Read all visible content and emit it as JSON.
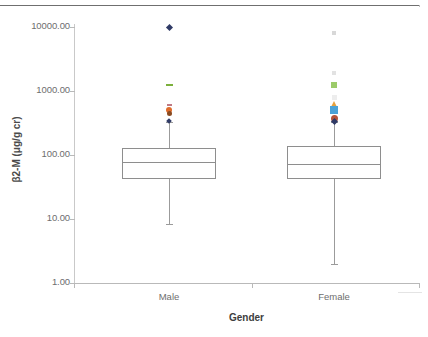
{
  "chart_data": {
    "type": "box",
    "title": "",
    "xlabel": "Gender",
    "ylabel": "β2-M (μg/g cr)",
    "yscale": "log",
    "ylim": [
      1.0,
      10000.0
    ],
    "grid": false,
    "legend": "none",
    "y_ticks": [
      {
        "label": "10000.00",
        "value": 10000.0
      },
      {
        "label": "1000.00",
        "value": 1000.0
      },
      {
        "label": "100.00",
        "value": 100.0
      },
      {
        "label": "10.00",
        "value": 10.0
      },
      {
        "label": "1.00",
        "value": 1.0
      }
    ],
    "categories": [
      "Male",
      "Female"
    ],
    "boxes": [
      {
        "name": "Male",
        "whisker_low": 8.5,
        "q1": 42.0,
        "median": 78.0,
        "q3": 130.0,
        "whisker_high": 330.0,
        "outliers": [
          {
            "value": 10000.0,
            "color": "#2f3a66",
            "shape": "diamond",
            "size": 5
          },
          {
            "value": 1250.0,
            "color": "#7cb03c",
            "shape": "dash",
            "size": 7
          },
          {
            "value": 600.0,
            "color": "#c07a84",
            "shape": "dash",
            "size": 5
          },
          {
            "value": 500.0,
            "color": "#e06c2a",
            "shape": "circle",
            "size": 6
          },
          {
            "value": 440.0,
            "color": "#8a4a20",
            "shape": "circle",
            "size": 5
          },
          {
            "value": 340.0,
            "color": "#2f3a66",
            "shape": "diamond",
            "size": 4
          }
        ]
      },
      {
        "name": "Female",
        "whisker_low": 2.0,
        "q1": 42.0,
        "median": 72.0,
        "q3": 140.0,
        "whisker_high": 330.0,
        "outliers": [
          {
            "value": 8000.0,
            "color": "#d8d8d8",
            "shape": "square",
            "size": 4
          },
          {
            "value": 1900.0,
            "color": "#e2e2e2",
            "shape": "square",
            "size": 4
          },
          {
            "value": 1250.0,
            "color": "#9ccb6a",
            "shape": "square",
            "size": 6
          },
          {
            "value": 800.0,
            "color": "#ededed",
            "shape": "square",
            "size": 5
          },
          {
            "value": 620.0,
            "color": "#e8a13c",
            "shape": "triangle",
            "size": 6
          },
          {
            "value": 500.0,
            "color": "#4ba3d8",
            "shape": "square",
            "size": 8
          },
          {
            "value": 370.0,
            "color": "#b5543a",
            "shape": "circle",
            "size": 7
          },
          {
            "value": 330.0,
            "color": "#2f3a66",
            "shape": "diamond",
            "size": 5
          }
        ]
      }
    ]
  },
  "axes": {
    "y_title": "β2-M (μg/g cr)",
    "x_title": "Gender",
    "y_labels": [
      "10000.00",
      "1000.00",
      "100.00",
      "10.00",
      "1.00"
    ],
    "x_labels": [
      "Male",
      "Female"
    ]
  },
  "colors": {
    "axis": "#b9b9b9",
    "box_stroke": "#8e8e8e",
    "whisker": "#9b9b9b",
    "tick_text": "#6e6e6e",
    "title_text": "#3d3d3d",
    "top_rule": "#6f6f6f",
    "background": "#ffffff"
  }
}
